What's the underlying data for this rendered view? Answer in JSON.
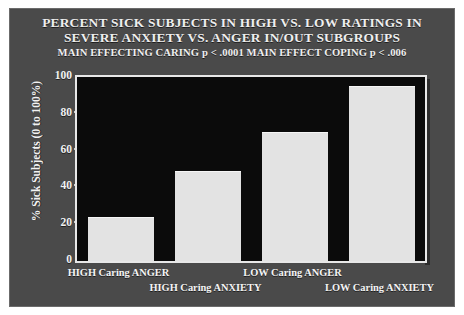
{
  "slide": {
    "title_line_1": "PERCENT SICK SUBJECTS IN HIGH VS. LOW RATINGS IN",
    "title_line_2": "SEVERE ANXIETY VS. ANGER IN/OUT SUBGROUPS",
    "title_line_3": "MAIN EFFECTING CARING p < .0001 MAIN EFFECT COPING p < .006",
    "background_color": "#4a4a4a",
    "plot_background_color": "#0b0b0b",
    "bar_color": "#e3e3e3",
    "text_color": "#f2f2f2"
  },
  "chart_data": {
    "type": "bar",
    "title": "PERCENT SICK SUBJECTS IN HIGH VS. LOW RATINGS IN SEVERE ANXIETY VS. ANGER IN/OUT SUBGROUPS",
    "subtitle": "MAIN EFFECTING CARING p < .0001 MAIN EFFECT COPING p < .006",
    "categories": [
      "HIGH Caring ANGER",
      "HIGH Caring ANXIETY",
      "LOW Caring ANGER",
      "LOW Caring ANXIETY"
    ],
    "values": [
      24,
      49,
      70,
      95
    ],
    "xlabel": "",
    "ylabel": "% Sick Subjects (0 to 100%)",
    "ylim": [
      0,
      100
    ],
    "yticks": [
      0,
      20,
      40,
      60,
      80,
      100
    ],
    "ytick_labels": [
      "0",
      "20",
      "40",
      "60",
      "80",
      "100"
    ],
    "grid": false,
    "legend": false,
    "annotations": [
      "MAIN EFFECTING CARING p < .0001",
      "MAIN EFFECT COPING p < .006"
    ]
  }
}
